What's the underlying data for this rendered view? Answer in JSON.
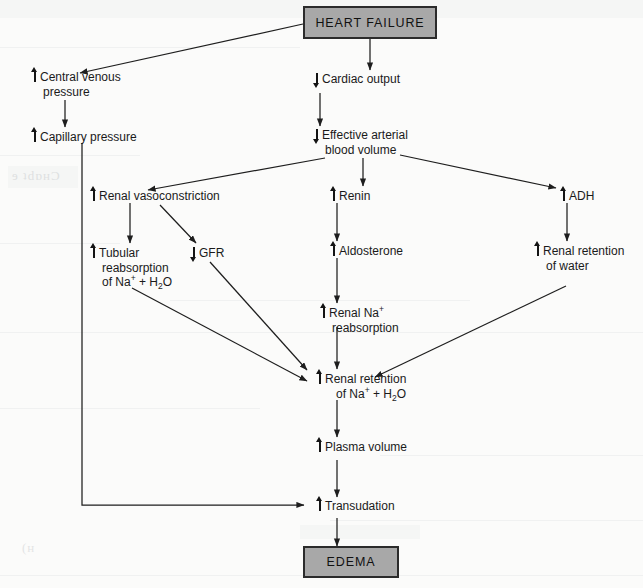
{
  "diagram": {
    "type": "flowchart",
    "terminals": {
      "start": "HEART FAILURE",
      "end": "EDEMA"
    },
    "nodes": [
      {
        "id": "central_venous_pressure",
        "direction": "up",
        "line1": "Central venous",
        "line2": "pressure"
      },
      {
        "id": "capillary_pressure",
        "direction": "up",
        "line1": "Capillary pressure",
        "line2": ""
      },
      {
        "id": "cardiac_output",
        "direction": "down",
        "line1": "Cardiac output",
        "line2": ""
      },
      {
        "id": "effective_arterial_blood_volume",
        "direction": "down",
        "line1": "Effective arterial",
        "line2": "blood volume"
      },
      {
        "id": "renal_vasoconstriction",
        "direction": "up",
        "line1": "Renal vasoconstriction",
        "line2": ""
      },
      {
        "id": "renin",
        "direction": "up",
        "line1": "Renin",
        "line2": ""
      },
      {
        "id": "adh",
        "direction": "up",
        "line1": "ADH",
        "line2": ""
      },
      {
        "id": "tubular_reabsorption",
        "direction": "up",
        "line1": "Tubular",
        "line2": "reabsorption",
        "line3_html": "of Na<sup>+</sup> + H<sub>2</sub>O"
      },
      {
        "id": "gfr",
        "direction": "down",
        "line1": "GFR",
        "line2": ""
      },
      {
        "id": "aldosterone",
        "direction": "up",
        "line1": "Aldosterone",
        "line2": ""
      },
      {
        "id": "renal_retention_water",
        "direction": "up",
        "line1": "Renal retention",
        "line2": "of water"
      },
      {
        "id": "renal_na_reabsorption",
        "direction": "up",
        "line1_html": "Renal Na<sup>+</sup>",
        "line2": "reabsorption"
      },
      {
        "id": "renal_retention_na_h2o",
        "direction": "up",
        "line1": "Renal retention",
        "line2_html": "of Na<sup>+</sup> + H<sub>2</sub>O"
      },
      {
        "id": "plasma_volume",
        "direction": "up",
        "line1": "Plasma volume",
        "line2": ""
      },
      {
        "id": "transudation",
        "direction": "up",
        "line1": "Transudation",
        "line2": ""
      }
    ],
    "edges": [
      {
        "from": "heart_failure",
        "to": "central_venous_pressure"
      },
      {
        "from": "central_venous_pressure",
        "to": "capillary_pressure"
      },
      {
        "from": "capillary_pressure",
        "to": "transudation"
      },
      {
        "from": "heart_failure",
        "to": "cardiac_output"
      },
      {
        "from": "cardiac_output",
        "to": "effective_arterial_blood_volume"
      },
      {
        "from": "effective_arterial_blood_volume",
        "to": "renal_vasoconstriction"
      },
      {
        "from": "effective_arterial_blood_volume",
        "to": "renin"
      },
      {
        "from": "effective_arterial_blood_volume",
        "to": "adh"
      },
      {
        "from": "renal_vasoconstriction",
        "to": "tubular_reabsorption"
      },
      {
        "from": "renal_vasoconstriction",
        "to": "gfr"
      },
      {
        "from": "renin",
        "to": "aldosterone"
      },
      {
        "from": "aldosterone",
        "to": "renal_na_reabsorption"
      },
      {
        "from": "adh",
        "to": "renal_retention_water"
      },
      {
        "from": "tubular_reabsorption",
        "to": "renal_retention_na_h2o"
      },
      {
        "from": "gfr",
        "to": "renal_retention_na_h2o"
      },
      {
        "from": "renal_na_reabsorption",
        "to": "renal_retention_na_h2o"
      },
      {
        "from": "renal_retention_water",
        "to": "renal_retention_na_h2o"
      },
      {
        "from": "renal_retention_na_h2o",
        "to": "plasma_volume"
      },
      {
        "from": "plasma_volume",
        "to": "transudation"
      },
      {
        "from": "transudation",
        "to": "edema"
      }
    ],
    "colors": {
      "terminal_fill": "#a8a8a8",
      "terminal_border": "#2b2b2b",
      "line": "#1e1e1e",
      "text": "#1a1a1a",
      "page": "#fbfbfa"
    }
  }
}
